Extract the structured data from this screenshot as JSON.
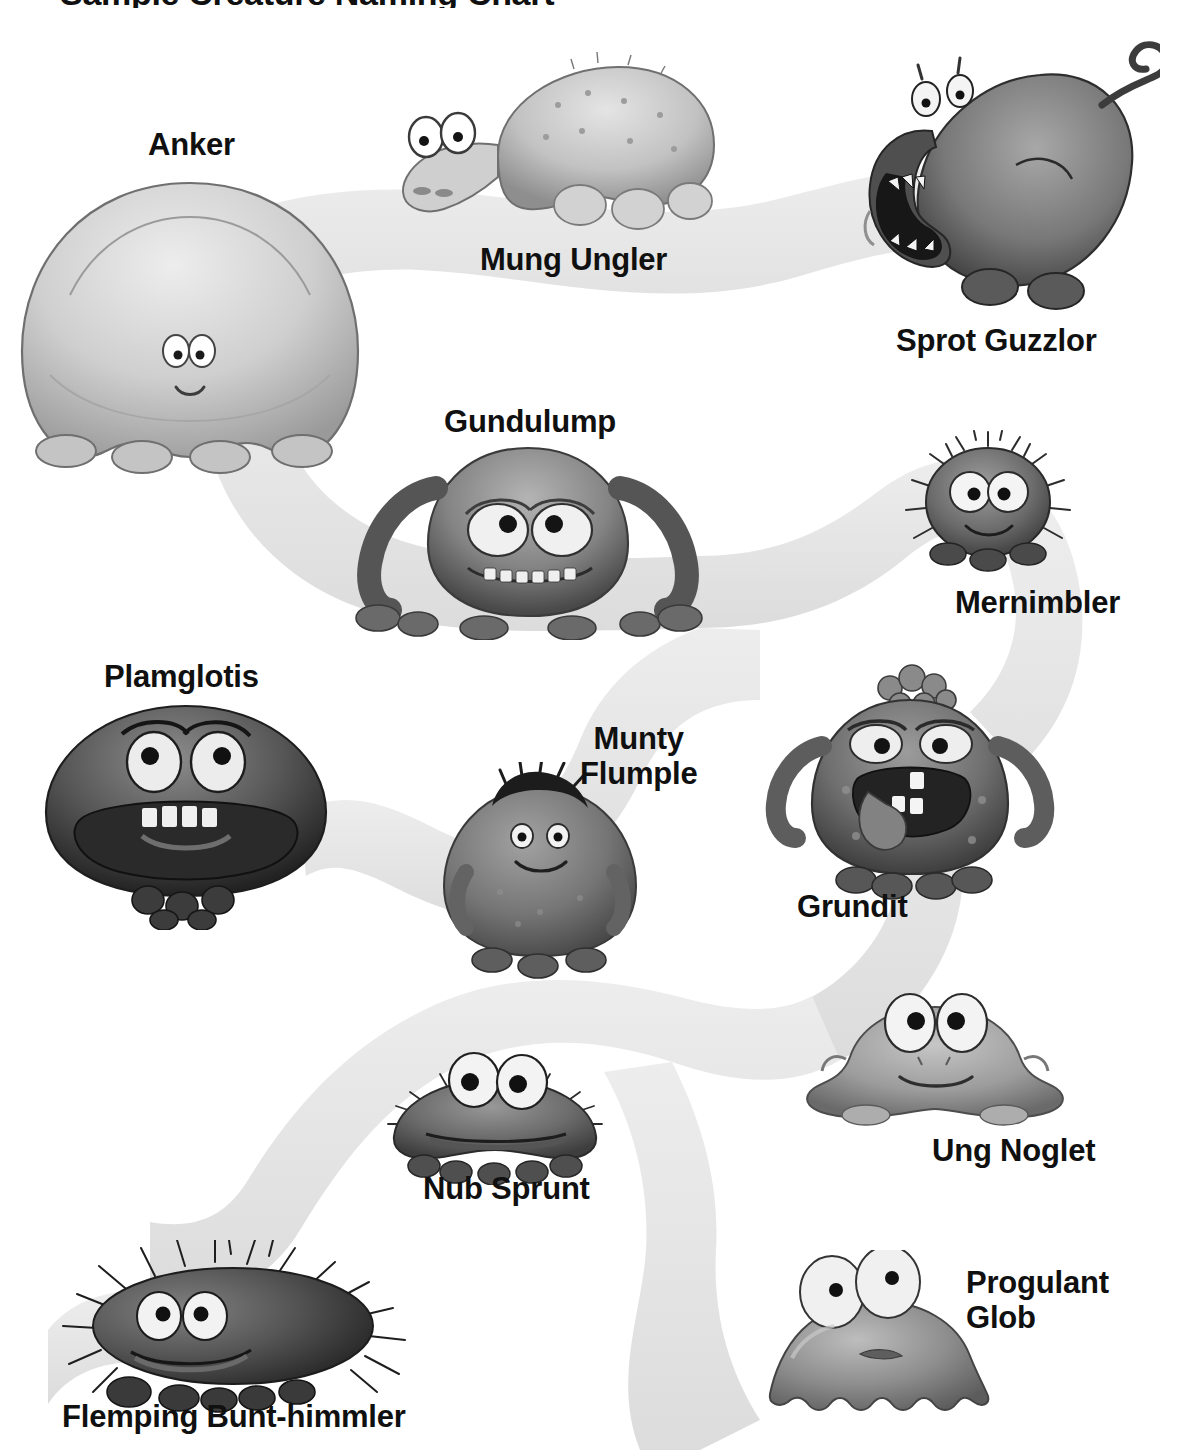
{
  "page": {
    "title_partial": "Sample Creature Naming Chart",
    "background_color": "#ffffff",
    "ribbon_color": "#e6e6e6",
    "ribbon_color_dark": "#d8d8d8",
    "text_color": "#101010",
    "width": 1181,
    "height": 1450
  },
  "creatures": [
    {
      "id": "anker",
      "label": "Anker",
      "label_lines": "Anker",
      "label_x": 148,
      "label_y": 128,
      "font_size": 31,
      "art_x": 10,
      "art_y": 175,
      "art_w": 360,
      "art_h": 305,
      "kind": "blob-hulk",
      "tone": "#bdbdbd"
    },
    {
      "id": "mung-ungler",
      "label": "Mung Ungler",
      "label_lines": "Mung Ungler",
      "label_x": 480,
      "label_y": 243,
      "font_size": 31,
      "art_x": 378,
      "art_y": 45,
      "art_w": 345,
      "art_h": 190,
      "kind": "lumpy-lizard",
      "tone": "#c6c6c6"
    },
    {
      "id": "sprot-guzzlor",
      "label": "Sprot Guzzlor",
      "label_lines": "Sprot Guzzlor",
      "label_x": 896,
      "label_y": 324,
      "font_size": 31,
      "art_x": 840,
      "art_y": 35,
      "art_w": 320,
      "art_h": 285,
      "kind": "fanged-beast",
      "tone": "#8a8a8a"
    },
    {
      "id": "gundulump",
      "label": "Gundulump",
      "label_lines": "Gundulump",
      "label_x": 444,
      "label_y": 405,
      "font_size": 31,
      "art_x": 318,
      "art_y": 440,
      "art_w": 420,
      "art_h": 200,
      "kind": "droopy-toad",
      "tone": "#8f8f8f"
    },
    {
      "id": "mernimbler",
      "label": "Mernimbler",
      "label_lines": "Mernimbler",
      "label_x": 955,
      "label_y": 586,
      "font_size": 31,
      "art_x": 886,
      "art_y": 430,
      "art_w": 205,
      "art_h": 150,
      "kind": "spiky-fuzzball",
      "tone": "#6e6e6e"
    },
    {
      "id": "plamglotis",
      "label": "Plamglotis",
      "label_lines": "Plamglotis",
      "label_x": 104,
      "label_y": 660,
      "font_size": 31,
      "art_x": 36,
      "art_y": 700,
      "art_w": 300,
      "art_h": 230,
      "kind": "big-lip-grump",
      "tone": "#5a5a5a"
    },
    {
      "id": "munty-flumple",
      "label": "Munty Flumple",
      "label_lines": "Munty\nFlumple",
      "label_x": 580,
      "label_y": 722,
      "font_size": 31,
      "art_x": 430,
      "art_y": 762,
      "art_w": 220,
      "art_h": 220,
      "kind": "round-hairy",
      "tone": "#767676"
    },
    {
      "id": "grundit",
      "label": "Grundit",
      "label_lines": "Grundit",
      "label_x": 797,
      "label_y": 890,
      "font_size": 31,
      "art_x": 760,
      "art_y": 660,
      "art_w": 300,
      "art_h": 250,
      "kind": "tongue-ogre",
      "tone": "#707070"
    },
    {
      "id": "ung-noglet",
      "label": "Ung Noglet",
      "label_lines": "Ung Noglet",
      "label_x": 932,
      "label_y": 1134,
      "font_size": 31,
      "art_x": 800,
      "art_y": 985,
      "art_w": 270,
      "art_h": 145,
      "kind": "flat-frog",
      "tone": "#9d9d9d"
    },
    {
      "id": "nub-sprunt",
      "label": "Nub Sprunt",
      "label_lines": "Nub Sprunt",
      "label_x": 423,
      "label_y": 1172,
      "font_size": 31,
      "art_x": 370,
      "art_y": 1050,
      "art_w": 250,
      "art_h": 135,
      "kind": "bug-eye-mound",
      "tone": "#6b6b6b"
    },
    {
      "id": "progulant-glob",
      "label": "Progulant Glob",
      "label_lines": "Progulant\nGlob",
      "label_x": 966,
      "label_y": 1266,
      "font_size": 31,
      "art_x": 740,
      "art_y": 1250,
      "art_w": 260,
      "art_h": 175,
      "kind": "slime-glob",
      "tone": "#8c8c8c"
    },
    {
      "id": "flemping-bunt-himmler",
      "label": "Flemping Bunt-himmler",
      "label_lines": "Flemping Bunt-himmler",
      "label_x": 62,
      "label_y": 1400,
      "font_size": 31,
      "art_x": 55,
      "art_y": 1240,
      "art_w": 390,
      "art_h": 175,
      "kind": "furry-spiky",
      "tone": "#4a4a4a"
    }
  ]
}
